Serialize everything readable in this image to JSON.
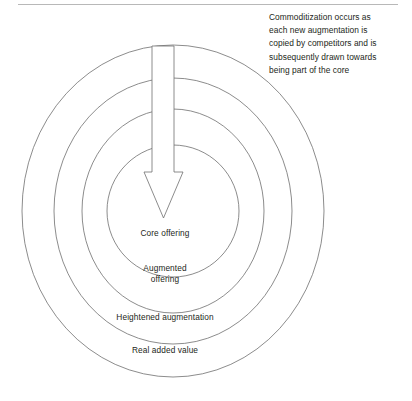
{
  "diagram": {
    "type": "concentric-rings",
    "background_color": "#ffffff",
    "stroke_color": "#6e6e6e",
    "text_color": "#231f20",
    "center": {
      "x": 173,
      "y": 211
    },
    "rings": [
      {
        "id": "core",
        "label": "Core offering",
        "rx": 66,
        "ry": 66,
        "level": 1
      },
      {
        "id": "augmented",
        "label_line1": "Augmented",
        "label_line2": "offering",
        "label": "Augmented offering",
        "rx": 91,
        "ry": 102,
        "level": 2
      },
      {
        "id": "heightened",
        "label": "Heightened augmentation",
        "rx": 119,
        "ry": 133,
        "level": 3
      },
      {
        "id": "real",
        "label": "Real added value",
        "rx": 151,
        "ry": 166,
        "level": 4
      }
    ],
    "arrow": {
      "name": "commoditization-arrow",
      "direction": "down",
      "shaft_x_left": 152,
      "shaft_x_right": 174,
      "shaft_top_y": 46,
      "head_top_y": 172,
      "head_tip_y": 218,
      "head_x_left": 144,
      "head_x_right": 183,
      "filled": false
    },
    "annotation": {
      "full_text": "Commoditization occurs as each new augmentation is copied by competitors and is subsequently drawn towards being part of the core",
      "lines": [
        "Commoditization occurs as",
        "each new augmentation is",
        "copied by competitors and is",
        "subsequently drawn towards",
        "being part of the core"
      ]
    }
  }
}
